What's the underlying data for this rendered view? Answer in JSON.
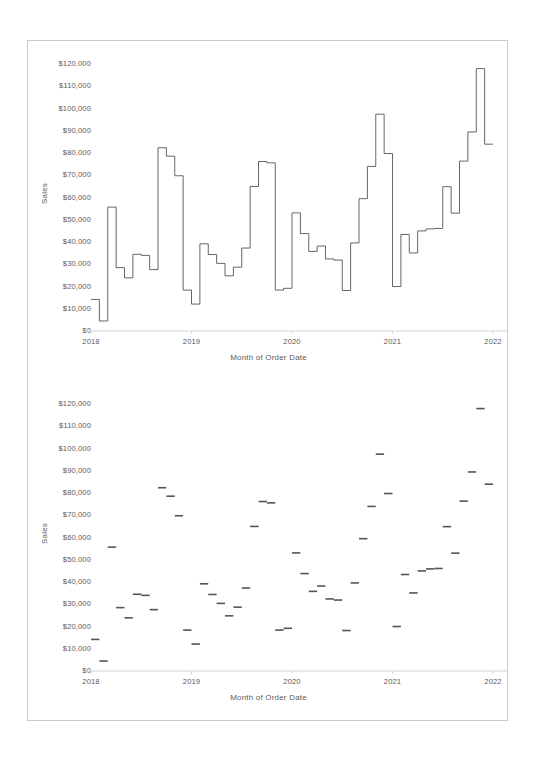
{
  "page": {
    "background": "#ffffff",
    "border_color": "#c9c9c9",
    "ink_color": "#555555"
  },
  "charts": [
    {
      "id": "top",
      "name": "step-line-chart",
      "axis_title_y": "Sales",
      "axis_title_x": "Month of Order Date"
    },
    {
      "id": "bottom",
      "name": "gantt-dash-chart",
      "axis_title_y": "Sales",
      "axis_title_x": "Month of Order Date"
    }
  ],
  "chart_data": [
    {
      "type": "line",
      "render": "step",
      "title": "",
      "xlabel": "Month of Order Date",
      "ylabel": "Sales",
      "ylim": [
        0,
        125000
      ],
      "ytick_labels": [
        "$0",
        "$10,000",
        "$20,000",
        "$30,000",
        "$40,000",
        "$50,000",
        "$60,000",
        "$70,000",
        "$80,000",
        "$90,000",
        "$100,000",
        "$110,000",
        "$120,000"
      ],
      "ytick_values": [
        0,
        10000,
        20000,
        30000,
        40000,
        50000,
        60000,
        70000,
        80000,
        90000,
        100000,
        110000,
        120000
      ],
      "xtick_labels": [
        "2018",
        "2019",
        "2020",
        "2021",
        "2022"
      ],
      "xlim": [
        "2018-01",
        "2022-01"
      ],
      "grid": false,
      "legend": "none",
      "x": [
        "2018-01",
        "2018-02",
        "2018-03",
        "2018-04",
        "2018-05",
        "2018-06",
        "2018-07",
        "2018-08",
        "2018-09",
        "2018-10",
        "2018-11",
        "2018-12",
        "2019-01",
        "2019-02",
        "2019-03",
        "2019-04",
        "2019-05",
        "2019-06",
        "2019-07",
        "2019-08",
        "2019-09",
        "2019-10",
        "2019-11",
        "2019-12",
        "2020-01",
        "2020-02",
        "2020-03",
        "2020-04",
        "2020-05",
        "2020-06",
        "2020-07",
        "2020-08",
        "2020-09",
        "2020-10",
        "2020-11",
        "2020-12",
        "2021-01",
        "2021-02",
        "2021-03",
        "2021-04",
        "2021-05",
        "2021-06",
        "2021-07",
        "2021-08",
        "2021-09",
        "2021-10",
        "2021-11",
        "2021-12"
      ],
      "values": [
        14200,
        4500,
        55700,
        28500,
        23900,
        34500,
        34000,
        27600,
        82400,
        78600,
        69800,
        18400,
        12100,
        39200,
        34400,
        30400,
        24800,
        28700,
        37300,
        65000,
        76200,
        75600,
        18400,
        19200,
        53100,
        43800,
        35800,
        38200,
        32400,
        31900,
        18200,
        39600,
        59500,
        74000,
        97500,
        79800,
        20000,
        43400,
        35100,
        45000,
        45900,
        46100,
        64900,
        53000,
        76400,
        89500,
        118000,
        84000
      ]
    },
    {
      "type": "scatter",
      "render": "dash-mark",
      "title": "",
      "xlabel": "Month of Order Date",
      "ylabel": "Sales",
      "ylim": [
        0,
        125000
      ],
      "ytick_labels": [
        "$0",
        "$10,000",
        "$20,000",
        "$30,000",
        "$40,000",
        "$50,000",
        "$60,000",
        "$70,000",
        "$80,000",
        "$90,000",
        "$100,000",
        "$110,000",
        "$120,000"
      ],
      "ytick_values": [
        0,
        10000,
        20000,
        30000,
        40000,
        50000,
        60000,
        70000,
        80000,
        90000,
        100000,
        110000,
        120000
      ],
      "xtick_labels": [
        "2018",
        "2019",
        "2020",
        "2021",
        "2022"
      ],
      "xlim": [
        "2018-01",
        "2022-01"
      ],
      "grid": false,
      "legend": "none",
      "x": [
        "2018-01",
        "2018-02",
        "2018-03",
        "2018-04",
        "2018-05",
        "2018-06",
        "2018-07",
        "2018-08",
        "2018-09",
        "2018-10",
        "2018-11",
        "2018-12",
        "2019-01",
        "2019-02",
        "2019-03",
        "2019-04",
        "2019-05",
        "2019-06",
        "2019-07",
        "2019-08",
        "2019-09",
        "2019-10",
        "2019-11",
        "2019-12",
        "2020-01",
        "2020-02",
        "2020-03",
        "2020-04",
        "2020-05",
        "2020-06",
        "2020-07",
        "2020-08",
        "2020-09",
        "2020-10",
        "2020-11",
        "2020-12",
        "2021-01",
        "2021-02",
        "2021-03",
        "2021-04",
        "2021-05",
        "2021-06",
        "2021-07",
        "2021-08",
        "2021-09",
        "2021-10",
        "2021-11",
        "2021-12"
      ],
      "values": [
        14200,
        4500,
        55700,
        28500,
        23900,
        34500,
        34000,
        27600,
        82400,
        78600,
        69800,
        18400,
        12100,
        39200,
        34400,
        30400,
        24800,
        28700,
        37300,
        65000,
        76200,
        75600,
        18400,
        19200,
        53100,
        43800,
        35800,
        38200,
        32400,
        31900,
        18200,
        39600,
        59500,
        74000,
        97500,
        79800,
        20000,
        43400,
        35100,
        45000,
        45900,
        46100,
        64900,
        53000,
        76400,
        89500,
        118000,
        84000
      ]
    }
  ]
}
